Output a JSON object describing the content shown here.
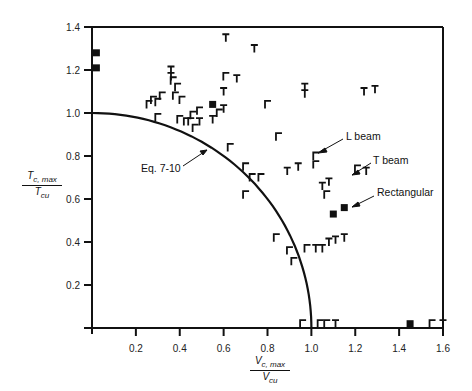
{
  "chart_data": {
    "type": "scatter",
    "title": "",
    "xlabel": "V_c,max / V_cu",
    "ylabel": "T_c,max / T_cu",
    "xlim": [
      0,
      1.6
    ],
    "ylim": [
      0,
      1.4
    ],
    "grid": false,
    "x_ticks": [
      "0.2",
      "0.4",
      "0.6",
      "0.8",
      "1.0",
      "1.2",
      "1.4",
      "1.6"
    ],
    "y_ticks": [
      "0.2",
      "0.4",
      "0.6",
      "0.8",
      "1.0",
      "1.2",
      "1.4"
    ],
    "curve": {
      "name": "Eq. 7-10",
      "description": "Circular interaction curve (T/Tcu)^2 + (V/Vcu)^2 = 1"
    },
    "series": [
      {
        "name": "Rectangular",
        "marker": "square",
        "points": [
          [
            0.02,
            1.28
          ],
          [
            0.02,
            1.21
          ],
          [
            0.55,
            1.04
          ],
          [
            1.1,
            0.53
          ],
          [
            1.15,
            0.56
          ],
          [
            1.45,
            0.02
          ]
        ]
      },
      {
        "name": "L beam",
        "marker": "L",
        "points": [
          [
            0.26,
            1.04
          ],
          [
            0.28,
            1.06
          ],
          [
            0.3,
            1.05
          ],
          [
            0.32,
            1.08
          ],
          [
            0.3,
            0.98
          ],
          [
            0.37,
            1.15
          ],
          [
            0.39,
            1.12
          ],
          [
            0.38,
            1.08
          ],
          [
            0.41,
            1.06
          ],
          [
            0.4,
            0.97
          ],
          [
            0.43,
            0.96
          ],
          [
            0.45,
            0.96
          ],
          [
            0.46,
            0.99
          ],
          [
            0.47,
            0.93
          ],
          [
            0.49,
            1.01
          ],
          [
            0.61,
            1.17
          ],
          [
            0.58,
            1.0
          ],
          [
            0.8,
            1.04
          ],
          [
            0.85,
            0.89
          ],
          [
            0.63,
            0.84
          ],
          [
            0.7,
            0.75
          ],
          [
            0.73,
            0.7
          ],
          [
            0.77,
            0.7
          ],
          [
            0.7,
            0.62
          ],
          [
            1.02,
            0.8
          ],
          [
            1.02,
            0.76
          ],
          [
            1.07,
            0.62
          ],
          [
            1.21,
            0.74
          ],
          [
            0.84,
            0.42
          ],
          [
            0.9,
            0.36
          ],
          [
            0.92,
            0.31
          ],
          [
            0.98,
            0.37
          ],
          [
            0.96,
            0.02
          ],
          [
            1.04,
            0.02
          ],
          [
            1.07,
            0.02
          ],
          [
            1.55,
            0.02
          ]
        ]
      },
      {
        "name": "T beam",
        "marker": "T",
        "points": [
          [
            0.36,
            1.2
          ],
          [
            0.36,
            1.17
          ],
          [
            0.61,
            1.35
          ],
          [
            0.74,
            1.3
          ],
          [
            0.66,
            1.16
          ],
          [
            0.6,
            1.1
          ],
          [
            0.6,
            1.02
          ],
          [
            0.97,
            1.12
          ],
          [
            0.97,
            1.09
          ],
          [
            1.24,
            1.1
          ],
          [
            1.29,
            1.11
          ],
          [
            0.55,
            0.97
          ],
          [
            0.49,
            0.96
          ],
          [
            0.89,
            0.73
          ],
          [
            0.94,
            0.75
          ],
          [
            1.25,
            0.73
          ],
          [
            1.05,
            0.66
          ],
          [
            1.08,
            0.68
          ],
          [
            1.02,
            0.37
          ],
          [
            1.05,
            0.37
          ],
          [
            1.08,
            0.4
          ],
          [
            1.11,
            0.41
          ],
          [
            1.15,
            0.42
          ],
          [
            1.11,
            0.02
          ],
          [
            1.6,
            0.02
          ]
        ]
      }
    ],
    "annotations": [
      {
        "text": "Eq. 7-10",
        "points_to": "curve"
      },
      {
        "text": "L beam",
        "points_to": "L beam marker"
      },
      {
        "text": "T beam",
        "points_to": "T beam marker"
      },
      {
        "text": "Rectangular",
        "points_to": "Rectangular marker"
      }
    ]
  },
  "labels": {
    "y_num": "T",
    "y_num_sub": "c, max",
    "y_den": "T",
    "y_den_sub": "cu",
    "x_num": "V",
    "x_num_sub": "c, max",
    "x_den": "V",
    "x_den_sub": "cu",
    "eq": "Eq. 7-10",
    "lbeam": "L beam",
    "tbeam": "T beam",
    "rect": "Rectangular"
  }
}
